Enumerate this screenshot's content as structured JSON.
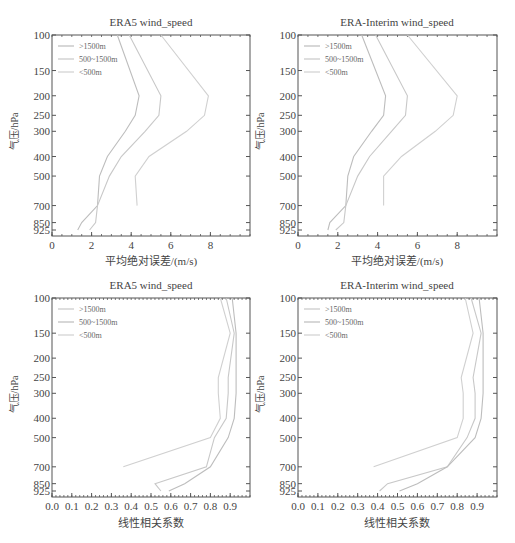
{
  "caption": "",
  "chart_data": [
    {
      "type": "line",
      "title": "ERA5 wind_speed",
      "xlabel": "平均绝对误差/(m/s)",
      "ylabel": "气压/hPa",
      "xlim": [
        0,
        10
      ],
      "xticks": [
        0,
        2,
        4,
        6,
        8
      ],
      "y_levels": [
        100,
        150,
        200,
        250,
        300,
        400,
        500,
        700,
        850,
        925
      ],
      "ylim": [
        100,
        925
      ],
      "y_reversed": true,
      "legend_position": "upper left",
      "series": [
        {
          "name": ">1500m",
          "color": "#bdbdbd",
          "y": [
            100,
            200,
            250,
            300,
            400,
            500,
            700,
            850,
            925
          ],
          "x": [
            3.3,
            4.4,
            4.2,
            3.7,
            2.8,
            2.4,
            2.3,
            1.5,
            1.3
          ]
        },
        {
          "name": "500~1500m",
          "color": "#c8c8c8",
          "y": [
            100,
            200,
            250,
            300,
            400,
            500,
            700,
            850,
            925
          ],
          "x": [
            3.9,
            5.5,
            5.4,
            4.7,
            3.5,
            2.9,
            2.3,
            2.2,
            1.9
          ]
        },
        {
          "name": "<500m",
          "color": "#d0d0d0",
          "y": [
            100,
            200,
            250,
            300,
            400,
            500,
            700
          ],
          "x": [
            5.5,
            7.9,
            7.7,
            6.8,
            4.9,
            4.2,
            4.3
          ]
        }
      ]
    },
    {
      "type": "line",
      "title": "ERA-Interim wind_speed",
      "xlabel": "平均绝对误差/(m/s)",
      "ylabel": "气压/hPa",
      "xlim": [
        0,
        10
      ],
      "xticks": [
        0,
        2,
        4,
        6,
        8
      ],
      "y_levels": [
        100,
        150,
        200,
        250,
        300,
        400,
        500,
        700,
        850,
        925
      ],
      "ylim": [
        100,
        925
      ],
      "y_reversed": true,
      "legend_position": "upper left",
      "series": [
        {
          "name": ">1500m",
          "color": "#bdbdbd",
          "y": [
            100,
            200,
            250,
            300,
            400,
            500,
            700,
            850,
            925
          ],
          "x": [
            3.2,
            4.4,
            4.3,
            3.7,
            2.8,
            2.5,
            2.4,
            1.6,
            1.5
          ]
        },
        {
          "name": "500~1500m",
          "color": "#c8c8c8",
          "y": [
            100,
            200,
            250,
            300,
            400,
            500,
            700,
            850,
            925
          ],
          "x": [
            3.9,
            5.5,
            5.4,
            4.7,
            3.6,
            3.0,
            2.4,
            2.3,
            1.9
          ]
        },
        {
          "name": "<500m",
          "color": "#d0d0d0",
          "y": [
            100,
            200,
            250,
            300,
            400,
            500,
            700
          ],
          "x": [
            5.5,
            8.0,
            7.8,
            6.9,
            5.2,
            4.3,
            4.3
          ]
        }
      ]
    },
    {
      "type": "line",
      "title": "ERA5 wind_speed",
      "xlabel": "线性相关系数",
      "ylabel": "气压/hPa",
      "xlim": [
        0,
        1.0
      ],
      "xticks": [
        0.0,
        0.1,
        0.2,
        0.3,
        0.4,
        0.5,
        0.6,
        0.7,
        0.8,
        0.9
      ],
      "y_levels": [
        100,
        150,
        200,
        250,
        300,
        400,
        500,
        700,
        850,
        925
      ],
      "ylim": [
        100,
        925
      ],
      "y_reversed": true,
      "legend_position": "upper left",
      "series": [
        {
          "name": ">1500m",
          "color": "#c8c8c8",
          "y": [
            100,
            150,
            250,
            300,
            400,
            500,
            700,
            850,
            925
          ],
          "x": [
            0.88,
            0.92,
            0.89,
            0.89,
            0.88,
            0.82,
            0.78,
            0.52,
            0.55
          ]
        },
        {
          "name": "500~1500m",
          "color": "#bdbdbd",
          "y": [
            100,
            150,
            300,
            400,
            500,
            700,
            850,
            925
          ],
          "x": [
            0.91,
            0.93,
            0.93,
            0.92,
            0.89,
            0.8,
            0.67,
            0.59
          ]
        },
        {
          "name": "<500m",
          "color": "#d0d0d0",
          "y": [
            100,
            150,
            250,
            300,
            400,
            500,
            700
          ],
          "x": [
            0.85,
            0.9,
            0.84,
            0.84,
            0.85,
            0.8,
            0.36
          ]
        }
      ]
    },
    {
      "type": "line",
      "title": "ERA-Interim wind_speed",
      "xlabel": "线性相关系数",
      "ylabel": "气压/hPa",
      "xlim": [
        0,
        1.0
      ],
      "xticks": [
        0.0,
        0.1,
        0.2,
        0.3,
        0.4,
        0.5,
        0.6,
        0.7,
        0.8,
        0.9
      ],
      "y_levels": [
        100,
        150,
        200,
        250,
        300,
        400,
        500,
        700,
        850,
        925
      ],
      "ylim": [
        100,
        925
      ],
      "y_reversed": true,
      "legend_position": "upper left",
      "series": [
        {
          "name": ">1500m",
          "color": "#c8c8c8",
          "y": [
            100,
            150,
            250,
            300,
            400,
            500,
            700,
            850,
            925
          ],
          "x": [
            0.87,
            0.92,
            0.88,
            0.89,
            0.89,
            0.85,
            0.75,
            0.45,
            0.41
          ]
        },
        {
          "name": "500~1500m",
          "color": "#bdbdbd",
          "y": [
            100,
            150,
            300,
            400,
            500,
            700,
            850,
            925
          ],
          "x": [
            0.91,
            0.93,
            0.93,
            0.92,
            0.89,
            0.75,
            0.6,
            0.51
          ]
        },
        {
          "name": "<500m",
          "color": "#d0d0d0",
          "y": [
            100,
            150,
            250,
            300,
            400,
            500,
            700
          ],
          "x": [
            0.84,
            0.88,
            0.82,
            0.83,
            0.83,
            0.8,
            0.38
          ]
        }
      ]
    }
  ],
  "panels": [
    {
      "title": "ERA5 wind_speed",
      "xlabel": "平均绝对误差/(m/s)",
      "ylabel": "气压/hPa"
    },
    {
      "title": "ERA-Interim wind_speed",
      "xlabel": "平均绝对误差/(m/s)",
      "ylabel": "气压/hPa"
    },
    {
      "title": "ERA5 wind_speed",
      "xlabel": "线性相关系数",
      "ylabel": "气压/hPa"
    },
    {
      "title": "ERA-Interim wind_speed",
      "xlabel": "线性相关系数",
      "ylabel": "气压/hPa"
    }
  ],
  "legend": [
    ">1500m",
    "500~1500m",
    "<500m"
  ]
}
